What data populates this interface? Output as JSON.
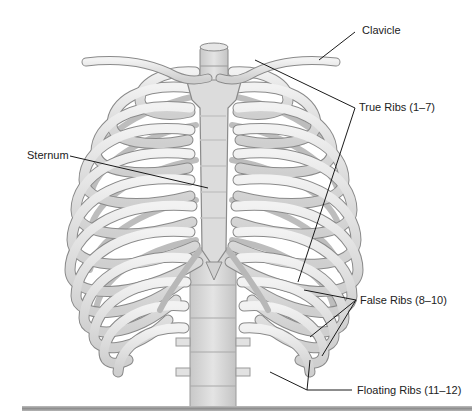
{
  "figure": {
    "labels": {
      "clavicle": "Clavicle",
      "true_ribs": "True Ribs (1–7)",
      "sternum": "Sternum",
      "false_ribs": "False Ribs (8–10)",
      "floating_ribs": "Floating Ribs (11–12)"
    },
    "colors": {
      "bone_fill": "#e6e6e6",
      "bone_shade": "#c9c9c9",
      "bone_outline": "#8a8a8a",
      "leader_line": "#1a1a1a",
      "bottom_bar": "#a3a3a3"
    }
  }
}
